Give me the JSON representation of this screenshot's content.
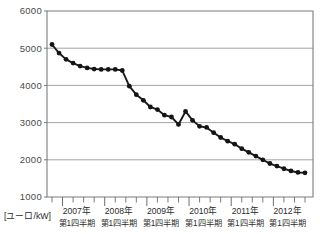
{
  "chart_data": {
    "type": "line",
    "title": "",
    "subtitle": "",
    "xlabel": "",
    "ylabel": "[ユーロ/kW]",
    "unit_label": "[ユーロ/kW]",
    "ylim": [
      1000,
      6000
    ],
    "ytick_values": [
      1000,
      2000,
      3000,
      4000,
      5000,
      6000
    ],
    "ytick_labels": [
      "1000",
      "2000",
      "3000",
      "4000",
      "5000",
      "6000"
    ],
    "grid": true,
    "legend": "none",
    "x_group_labels": [
      "2007年",
      "2008年",
      "2009年",
      "2010年",
      "2011年",
      "2012年"
    ],
    "x_group_sublabels": [
      "第1四半期",
      "第1四半期",
      "第1四半期",
      "第1四半期",
      "第1四半期",
      "第1四半期"
    ],
    "x_categories": [
      "2006 Q4",
      "2007 Q1",
      "2007 Q2",
      "2007 Q3",
      "2007 Q4",
      "2008 Q1",
      "2008 Q2",
      "2008 Q3",
      "2008 Q4",
      "2009 Q1",
      "2009 Q2",
      "2009 Q3",
      "2009 Q4",
      "2010 Q1",
      "2010 Q2",
      "2010 Q3",
      "2010 Q4",
      "2011 Q1",
      "2011 Q2",
      "2011 Q3",
      "2011 Q4",
      "2012 Q1",
      "2012 Q2",
      "2012 Q3",
      "2012 Q4"
    ],
    "series": [
      {
        "name": "価格",
        "values": [
          5100,
          4870,
          4700,
          4600,
          4520,
          4470,
          4440,
          4430,
          4430,
          4430,
          4430,
          4400,
          3980,
          3750,
          3600,
          3420,
          3350,
          3200,
          3150,
          2950,
          3300,
          3060,
          2900,
          2870,
          2730
        ]
      }
    ],
    "detailed_points": [
      {
        "x": 0,
        "y": 5100
      },
      {
        "x": 1,
        "y": 4870
      },
      {
        "x": 2,
        "y": 4700
      },
      {
        "x": 3,
        "y": 4600
      },
      {
        "x": 4,
        "y": 4520
      },
      {
        "x": 5,
        "y": 4470
      },
      {
        "x": 6,
        "y": 4440
      },
      {
        "x": 7,
        "y": 4430
      },
      {
        "x": 8,
        "y": 4430
      },
      {
        "x": 9,
        "y": 4430
      },
      {
        "x": 10,
        "y": 4400
      },
      {
        "x": 11,
        "y": 3980
      },
      {
        "x": 12,
        "y": 3750
      },
      {
        "x": 13,
        "y": 3600
      },
      {
        "x": 14,
        "y": 3420
      },
      {
        "x": 15,
        "y": 3350
      },
      {
        "x": 16,
        "y": 3200
      },
      {
        "x": 17,
        "y": 3150
      },
      {
        "x": 18,
        "y": 2950
      },
      {
        "x": 19,
        "y": 3300
      },
      {
        "x": 20,
        "y": 3060
      },
      {
        "x": 21,
        "y": 2900
      },
      {
        "x": 22,
        "y": 2870
      },
      {
        "x": 23,
        "y": 2730
      },
      {
        "x": 24,
        "y": 2600
      },
      {
        "x": 25,
        "y": 2500
      },
      {
        "x": 26,
        "y": 2420
      },
      {
        "x": 27,
        "y": 2300
      },
      {
        "x": 28,
        "y": 2200
      },
      {
        "x": 29,
        "y": 2100
      },
      {
        "x": 30,
        "y": 2000
      },
      {
        "x": 31,
        "y": 1900
      },
      {
        "x": 32,
        "y": 1830
      },
      {
        "x": 33,
        "y": 1760
      },
      {
        "x": 34,
        "y": 1700
      },
      {
        "x": 35,
        "y": 1660
      },
      {
        "x": 36,
        "y": 1650
      }
    ],
    "notes": {
      "start_value": 5100,
      "end_value": 1650,
      "peak_value": 5100,
      "min_value": 1650,
      "plateau_value": 4430,
      "rebound_peak": 3300,
      "rebound_dip": 2950
    }
  },
  "axis": {
    "y_min_label": "1000",
    "y_max_label": "6000"
  }
}
